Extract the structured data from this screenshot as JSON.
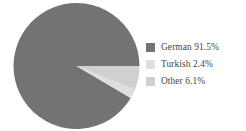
{
  "chart_data": {
    "type": "pie",
    "title": "",
    "subtitle": "",
    "xlabel": "",
    "ylabel": "",
    "grid": false,
    "legend_position": "right",
    "unit": "%",
    "start_angle_deg": 0,
    "direction": "counterclockwise",
    "categories": [
      "German",
      "Turkish",
      "Other"
    ],
    "values": [
      91.5,
      2.4,
      6.1
    ],
    "colors": [
      "#6e6e6e",
      "#dedede",
      "#cfcfcf"
    ],
    "slices": [
      {
        "label": "German",
        "value": 91.5,
        "value_text": "91.5%",
        "color": "#6e6e6e"
      },
      {
        "label": "Turkish",
        "value": 2.4,
        "value_text": "2.4%",
        "color": "#dedede"
      },
      {
        "label": "Other",
        "value": 6.1,
        "value_text": "6.1%",
        "color": "#cfcfcf"
      }
    ]
  },
  "legend": {
    "entries": [
      {
        "text": "German 91.5%",
        "swatch": "#6e6e6e",
        "swatch_name": "legend-swatch-german"
      },
      {
        "text": "Turkish 2.4%",
        "swatch": "#dedede",
        "swatch_name": "legend-swatch-turkish"
      },
      {
        "text": "Other 6.1%",
        "swatch": "#cfcfcf",
        "swatch_name": "legend-swatch-other"
      }
    ]
  },
  "geometry": {
    "center_x": 64.5,
    "center_y": 64,
    "radius": 63
  }
}
